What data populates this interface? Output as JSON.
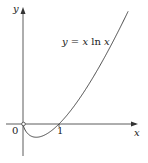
{
  "chart_data": {
    "type": "line",
    "title": "",
    "function_label": "y = x ln x",
    "xlabel": "x",
    "ylabel": "y",
    "origin_label": "0",
    "x_ticks": [
      {
        "value": 1,
        "label": "1"
      }
    ],
    "xlim": [
      -0.6,
      3.4
    ],
    "ylim": [
      -1.1,
      3.3
    ],
    "grid": false,
    "legend": "none",
    "series": [
      {
        "name": "y = x ln x",
        "x": [
          0,
          0.1,
          0.2,
          0.3,
          0.368,
          0.5,
          0.7,
          1.0,
          1.5,
          2.0,
          2.5,
          2.92
        ],
        "values": [
          0,
          -0.23,
          -0.32,
          -0.36,
          -0.368,
          -0.35,
          -0.25,
          0,
          0.61,
          1.39,
          2.29,
          3.13
        ]
      }
    ],
    "annotations": [
      {
        "text": "open circle at origin (0, 0)",
        "x": 0,
        "y": 0
      },
      {
        "text": "minimum near x = 1/e",
        "x": 0.368,
        "y": -0.368
      }
    ]
  },
  "labels": {
    "y_axis": "y",
    "x_axis": "x",
    "origin": "0",
    "tick_one": "1",
    "equation_lhs": "y",
    "equation_eq": " = ",
    "equation_x": "x",
    "equation_ln": " ln ",
    "equation_x2": "x"
  }
}
